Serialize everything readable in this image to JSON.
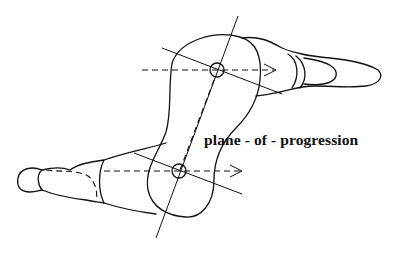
{
  "figure": {
    "label": "plane - of - progression",
    "elements": [
      "limb-segment-outline",
      "upper-joint-center",
      "lower-joint-center",
      "long-axis",
      "progression-arrow-upper",
      "progression-arrow-lower",
      "transverse-axis-upper",
      "transverse-axis-lower",
      "foot-upper-right",
      "foot-lower-left"
    ],
    "ink_color": "#111111",
    "background_color": "#ffffff"
  }
}
